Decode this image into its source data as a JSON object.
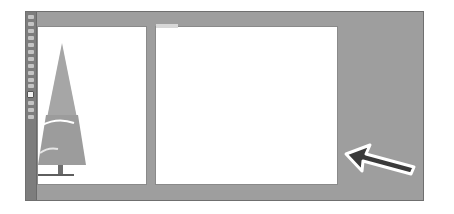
{
  "app": {
    "type": "vector-design-editor",
    "colorMode": "grayscale-screenshot"
  },
  "toolbar": {
    "tools": [
      {
        "name": "selection-tool"
      },
      {
        "name": "direct-selection-tool"
      },
      {
        "name": "magic-wand-tool"
      },
      {
        "name": "pen-tool"
      },
      {
        "name": "type-tool"
      },
      {
        "name": "line-tool"
      },
      {
        "name": "rectangle-tool"
      },
      {
        "name": "paintbrush-tool"
      },
      {
        "name": "pencil-tool"
      },
      {
        "name": "rotate-tool"
      },
      {
        "name": "scale-tool"
      },
      {
        "name": "fill-stroke-swatch"
      },
      {
        "name": "color-mode-buttons"
      },
      {
        "name": "draw-mode"
      },
      {
        "name": "screen-mode"
      }
    ]
  },
  "canvas": {
    "artboards": [
      {
        "name": "artboard-1",
        "content": "christmas-tree-illustration"
      },
      {
        "name": "artboard-2",
        "content": "empty"
      }
    ]
  },
  "annotation": {
    "type": "callout-arrow",
    "direction": "up-left",
    "points_to": "canvas-area"
  },
  "colors": {
    "canvas": "#9e9e9e",
    "toolbar": "#7d7d7d",
    "artboard": "#ffffff",
    "tree": "#9a9a9a",
    "trunk": "#6e6e6e",
    "arrow_fill": "#3a3a3a",
    "arrow_outline": "#ffffff"
  }
}
